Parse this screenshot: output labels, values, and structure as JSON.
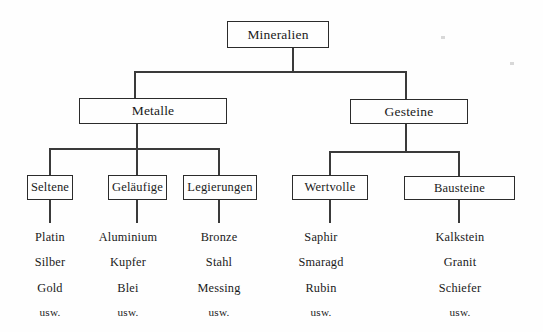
{
  "diagram": {
    "title_node": {
      "label": "Mineralien"
    },
    "level2": [
      {
        "label": "Metalle"
      },
      {
        "label": "Gesteine"
      }
    ],
    "level3": [
      {
        "label": "Seltene"
      },
      {
        "label": "Geläufige"
      },
      {
        "label": "Legierungen"
      },
      {
        "label": "Wertvolle"
      },
      {
        "label": "Bausteine"
      }
    ],
    "leaf_columns": [
      {
        "parent": "Seltene",
        "items": [
          "Platin",
          "Silber",
          "Gold",
          "usw."
        ]
      },
      {
        "parent": "Geläufige",
        "items": [
          "Aluminium",
          "Kupfer",
          "Blei",
          "usw."
        ]
      },
      {
        "parent": "Legierungen",
        "items": [
          "Bronze",
          "Stahl",
          "Messing",
          "usw."
        ]
      },
      {
        "parent": "Wertvolle",
        "items": [
          "Saphir",
          "Smaragd",
          "Rubin",
          "usw."
        ]
      },
      {
        "parent": "Bausteine",
        "items": [
          "Kalkstein",
          "Granit",
          "Schiefer",
          "usw."
        ]
      }
    ],
    "colors": {
      "background": "#fefefe",
      "line": "#3a3a3a",
      "border": "#2b2b2b",
      "text": "#1a1a1a"
    }
  }
}
